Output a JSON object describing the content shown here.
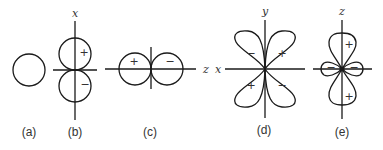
{
  "figure": {
    "panels": [
      {
        "id": "a",
        "caption": "(a)",
        "shape": "s-orbital",
        "axes": [],
        "signs": []
      },
      {
        "id": "b",
        "caption": "(b)",
        "shape": "p-orbital-vertical",
        "axes": [
          "x"
        ],
        "signs": [
          "+",
          "−"
        ]
      },
      {
        "id": "c",
        "caption": "(c)",
        "shape": "p-orbital-horizontal",
        "axes": [
          "z"
        ],
        "signs": [
          "+",
          "−"
        ]
      },
      {
        "id": "d",
        "caption": "(d)",
        "shape": "d-orbital-cloverleaf",
        "axes": [
          "y",
          "x"
        ],
        "signs": [
          "−",
          "+",
          "+",
          "−"
        ]
      },
      {
        "id": "e",
        "caption": "(e)",
        "shape": "dz2-orbital",
        "axes": [
          "z"
        ],
        "signs": [
          "+",
          "−",
          "−",
          "+"
        ]
      }
    ]
  },
  "colors": {
    "stroke": "#1a1a1a",
    "text": "#333333",
    "background": "#ffffff"
  }
}
